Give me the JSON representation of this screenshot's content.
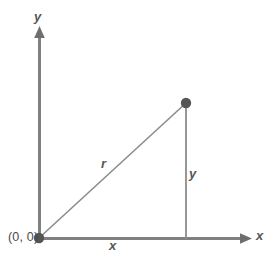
{
  "figure": {
    "type": "geometry-diagram",
    "background_color": "#ffffff",
    "stroke_color": "#808080",
    "dark_stroke_color": "#6e6e6e",
    "label_color": "#4d4d4d",
    "axes": {
      "y_axis_label": "y",
      "x_axis_label": "x",
      "origin_label": "(0, 0)"
    },
    "labels": {
      "hypotenuse": "r",
      "vertical_leg": "y",
      "horizontal_leg": "x"
    },
    "geometry": {
      "origin": {
        "x": 39,
        "y": 238
      },
      "point": {
        "x": 186,
        "y": 103
      },
      "y_axis_top": {
        "x": 39,
        "y": 27
      },
      "x_axis_right": {
        "x": 252,
        "y": 238
      },
      "point_dot_radius": 5,
      "origin_dot_radius": 5
    }
  }
}
